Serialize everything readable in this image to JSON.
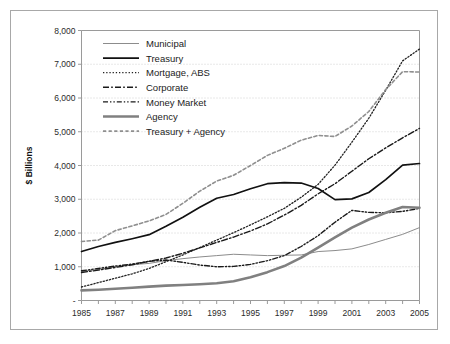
{
  "chart_data": {
    "type": "line",
    "title": "",
    "xlabel": "",
    "ylabel": "$ Billions",
    "xlim": [
      1985,
      2005
    ],
    "ylim": [
      0,
      8000
    ],
    "grid": true,
    "legend_position": "top-left-inside",
    "y_ticks": [
      0,
      1000,
      2000,
      3000,
      4000,
      5000,
      6000,
      7000,
      8000
    ],
    "y_tick_labels": [
      "-",
      "1,000",
      "2,000",
      "3,000",
      "4,000",
      "5,000",
      "6,000",
      "7,000",
      "8,000"
    ],
    "x_ticks": [
      1985,
      1986,
      1987,
      1988,
      1989,
      1990,
      1991,
      1992,
      1993,
      1994,
      1995,
      1996,
      1997,
      1998,
      1999,
      2000,
      2001,
      2002,
      2003,
      2004,
      2005
    ],
    "x_tick_labels": [
      "1985",
      "",
      "1987",
      "",
      "1989",
      "",
      "1991",
      "",
      "1993",
      "",
      "1995",
      "",
      "1997",
      "",
      "1999",
      "",
      "2001",
      "",
      "2003",
      "",
      "2005"
    ],
    "x": [
      1985,
      1986,
      1987,
      1988,
      1989,
      1990,
      1991,
      1992,
      1993,
      1994,
      1995,
      1996,
      1997,
      1998,
      1999,
      2000,
      2001,
      2002,
      2003,
      2004,
      2005
    ],
    "series": [
      {
        "name": "Municipal",
        "style": "solid",
        "color": "#8c8c8c",
        "width": 1.0,
        "dash": "",
        "values": [
          860,
          920,
          1000,
          1060,
          1100,
          1180,
          1240,
          1290,
          1330,
          1370,
          1350,
          1330,
          1340,
          1350,
          1450,
          1480,
          1530,
          1660,
          1810,
          1960,
          2160
        ]
      },
      {
        "name": "Treasury",
        "style": "solid",
        "color": "#111111",
        "width": 1.7,
        "dash": "",
        "values": [
          1450,
          1600,
          1720,
          1830,
          1950,
          2200,
          2470,
          2760,
          3030,
          3140,
          3310,
          3460,
          3490,
          3480,
          3320,
          2990,
          3010,
          3200,
          3580,
          4010,
          4060
        ]
      },
      {
        "name": "Mortgage, ABS",
        "style": "dotted",
        "color": "#222222",
        "width": 1.3,
        "dash": "1.3 1.9",
        "values": [
          400,
          530,
          660,
          790,
          950,
          1150,
          1350,
          1570,
          1790,
          2010,
          2240,
          2480,
          2730,
          3060,
          3440,
          4010,
          4690,
          5400,
          6230,
          7100,
          7450
        ]
      },
      {
        "name": "Corporate",
        "style": "dashdot",
        "color": "#1a1a1a",
        "width": 1.4,
        "dash": "6 2.2 1.6 2.2",
        "values": [
          830,
          900,
          980,
          1060,
          1160,
          1260,
          1400,
          1560,
          1720,
          1880,
          2060,
          2270,
          2530,
          2820,
          3160,
          3460,
          3830,
          4200,
          4520,
          4820,
          5100
        ]
      },
      {
        "name": "Money Market",
        "style": "dashdotdot",
        "color": "#1a1a1a",
        "width": 1.4,
        "dash": "5 2 1.4 2 1.4 2",
        "values": [
          880,
          950,
          1020,
          1080,
          1160,
          1200,
          1130,
          1050,
          1000,
          1010,
          1070,
          1180,
          1330,
          1600,
          1920,
          2320,
          2670,
          2610,
          2600,
          2640,
          2730
        ]
      },
      {
        "name": "Agency",
        "style": "solid",
        "color": "#808080",
        "width": 2.6,
        "dash": "",
        "values": [
          300,
          320,
          350,
          380,
          410,
          440,
          460,
          480,
          510,
          570,
          690,
          840,
          1020,
          1270,
          1570,
          1870,
          2160,
          2400,
          2600,
          2770,
          2750
        ]
      },
      {
        "name": "Treasury + Agency",
        "style": "dashed",
        "color": "#8f8f8f",
        "width": 1.6,
        "dash": "3.2 2.4",
        "values": [
          1750,
          1790,
          2070,
          2210,
          2360,
          2550,
          2880,
          3240,
          3540,
          3710,
          4000,
          4300,
          4510,
          4750,
          4890,
          4860,
          5170,
          5600,
          6250,
          6780,
          6770
        ]
      }
    ]
  },
  "legend": {
    "items": [
      {
        "label": "Municipal"
      },
      {
        "label": "Treasury"
      },
      {
        "label": "Mortgage, ABS"
      },
      {
        "label": "Corporate"
      },
      {
        "label": "Money Market"
      },
      {
        "label": "Agency"
      },
      {
        "label": "Treasury + Agency"
      }
    ]
  }
}
